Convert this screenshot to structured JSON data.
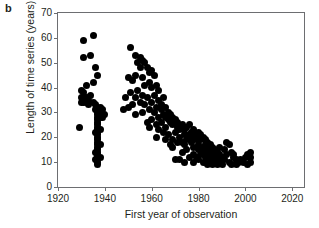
{
  "panel": {
    "label": "b"
  },
  "axes": {
    "xlabel": "First year of observation",
    "ylabel": "Length of time series (years)",
    "xticks": [
      1920,
      1940,
      1960,
      1980,
      2000,
      2020
    ],
    "yticks": [
      0,
      10,
      20,
      30,
      40,
      50,
      60,
      70
    ]
  },
  "chart_data": {
    "type": "scatter",
    "title": "",
    "xlabel": "First year of observation",
    "ylabel": "Length of time series (years)",
    "xlim": [
      1920,
      2025
    ],
    "ylim": [
      0,
      70
    ],
    "xticks": [
      1920,
      1940,
      1960,
      1980,
      2000,
      2020
    ],
    "yticks": [
      0,
      10,
      20,
      30,
      40,
      50,
      60,
      70
    ],
    "grid": false,
    "legend": null,
    "marker": {
      "shape": "circle",
      "color": "#000000",
      "size_px": 7
    },
    "points": [
      [
        1931,
        59
      ],
      [
        1935,
        61
      ],
      [
        1931,
        52
      ],
      [
        1934,
        53
      ],
      [
        1936,
        48
      ],
      [
        1937,
        45
      ],
      [
        1935,
        42
      ],
      [
        1932,
        41
      ],
      [
        1930,
        39
      ],
      [
        1931,
        38
      ],
      [
        1930,
        36
      ],
      [
        1932,
        36
      ],
      [
        1934,
        37
      ],
      [
        1933,
        35
      ],
      [
        1932,
        34
      ],
      [
        1931,
        34
      ],
      [
        1930,
        34
      ],
      [
        1933,
        33
      ],
      [
        1935,
        34
      ],
      [
        1936,
        33
      ],
      [
        1929,
        24
      ],
      [
        1937,
        32
      ],
      [
        1938,
        32
      ],
      [
        1939,
        31
      ],
      [
        1938,
        30
      ],
      [
        1937,
        31
      ],
      [
        1936,
        31
      ],
      [
        1938,
        28
      ],
      [
        1939,
        28
      ],
      [
        1940,
        29
      ],
      [
        1937,
        30
      ],
      [
        1937,
        29
      ],
      [
        1937,
        28
      ],
      [
        1937,
        27
      ],
      [
        1937,
        26
      ],
      [
        1937,
        25
      ],
      [
        1937,
        24
      ],
      [
        1937,
        23
      ],
      [
        1937,
        22
      ],
      [
        1937,
        21
      ],
      [
        1937,
        20
      ],
      [
        1937,
        19
      ],
      [
        1937,
        18
      ],
      [
        1937,
        17
      ],
      [
        1937,
        16
      ],
      [
        1937,
        15
      ],
      [
        1937,
        14
      ],
      [
        1937,
        13
      ],
      [
        1937,
        12
      ],
      [
        1937,
        11
      ],
      [
        1937,
        10
      ],
      [
        1937,
        9
      ],
      [
        1936,
        14
      ],
      [
        1936,
        11
      ],
      [
        1938,
        12
      ],
      [
        1938,
        17
      ],
      [
        1936,
        22
      ],
      [
        1938,
        23
      ],
      [
        1951,
        56
      ],
      [
        1953,
        53
      ],
      [
        1955,
        52
      ],
      [
        1956,
        51
      ],
      [
        1954,
        50
      ],
      [
        1957,
        50
      ],
      [
        1955,
        48
      ],
      [
        1958,
        48
      ],
      [
        1953,
        45
      ],
      [
        1950,
        44
      ],
      [
        1952,
        43
      ],
      [
        1956,
        44
      ],
      [
        1959,
        46
      ],
      [
        1960,
        47
      ],
      [
        1961,
        45
      ],
      [
        1959,
        42
      ],
      [
        1957,
        41
      ],
      [
        1954,
        39
      ],
      [
        1951,
        38
      ],
      [
        1949,
        36
      ],
      [
        1953,
        36
      ],
      [
        1956,
        37
      ],
      [
        1960,
        40
      ],
      [
        1962,
        41
      ],
      [
        1963,
        39
      ],
      [
        1961,
        37
      ],
      [
        1958,
        36
      ],
      [
        1955,
        34
      ],
      [
        1952,
        33
      ],
      [
        1950,
        32
      ],
      [
        1948,
        31
      ],
      [
        1957,
        33
      ],
      [
        1960,
        34
      ],
      [
        1963,
        35
      ],
      [
        1965,
        36
      ],
      [
        1964,
        33
      ],
      [
        1962,
        32
      ],
      [
        1959,
        31
      ],
      [
        1956,
        30
      ],
      [
        1953,
        29
      ],
      [
        1961,
        30
      ],
      [
        1964,
        31
      ],
      [
        1966,
        32
      ],
      [
        1967,
        30
      ],
      [
        1965,
        29
      ],
      [
        1963,
        28
      ],
      [
        1960,
        27
      ],
      [
        1958,
        26
      ],
      [
        1966,
        28
      ],
      [
        1968,
        29
      ],
      [
        1969,
        28
      ],
      [
        1967,
        27
      ],
      [
        1964,
        26
      ],
      [
        1962,
        25
      ],
      [
        1959,
        24
      ],
      [
        1968,
        26
      ],
      [
        1970,
        27
      ],
      [
        1971,
        26
      ],
      [
        1969,
        25
      ],
      [
        1966,
        24
      ],
      [
        1963,
        23
      ],
      [
        1971,
        24
      ],
      [
        1973,
        25
      ],
      [
        1972,
        23
      ],
      [
        1970,
        22
      ],
      [
        1967,
        21
      ],
      [
        1974,
        23
      ],
      [
        1975,
        24
      ],
      [
        1976,
        25
      ],
      [
        1974,
        21
      ],
      [
        1972,
        20
      ],
      [
        1969,
        19
      ],
      [
        1976,
        21
      ],
      [
        1977,
        22
      ],
      [
        1978,
        23
      ],
      [
        1977,
        20
      ],
      [
        1975,
        19
      ],
      [
        1973,
        18
      ],
      [
        1979,
        21
      ],
      [
        1980,
        22
      ],
      [
        1981,
        21
      ],
      [
        1979,
        19
      ],
      [
        1977,
        18
      ],
      [
        1974,
        17
      ],
      [
        1981,
        19
      ],
      [
        1982,
        20
      ],
      [
        1983,
        19
      ],
      [
        1980,
        17
      ],
      [
        1978,
        16
      ],
      [
        1983,
        17
      ],
      [
        1984,
        18
      ],
      [
        1982,
        16
      ],
      [
        1980,
        15
      ],
      [
        1985,
        17
      ],
      [
        1986,
        16
      ],
      [
        1984,
        15
      ],
      [
        1982,
        14
      ],
      [
        1986,
        14
      ],
      [
        1987,
        15
      ],
      [
        1985,
        13
      ],
      [
        1983,
        12
      ],
      [
        1987,
        13
      ],
      [
        1988,
        14
      ],
      [
        1986,
        12
      ],
      [
        1984,
        11
      ],
      [
        1988,
        12
      ],
      [
        1989,
        13
      ],
      [
        1987,
        11
      ],
      [
        1985,
        10
      ],
      [
        1970,
        11
      ],
      [
        1972,
        11
      ],
      [
        1974,
        10
      ],
      [
        1976,
        12
      ],
      [
        1978,
        13
      ],
      [
        1979,
        12
      ],
      [
        1981,
        13
      ],
      [
        1983,
        14
      ],
      [
        1989,
        11
      ],
      [
        1990,
        12
      ],
      [
        1991,
        11
      ],
      [
        1992,
        18
      ],
      [
        1993,
        17
      ],
      [
        1994,
        14
      ],
      [
        1995,
        13
      ],
      [
        1995,
        12
      ],
      [
        1996,
        11
      ],
      [
        1996,
        10
      ],
      [
        1996,
        9
      ],
      [
        1997,
        10
      ],
      [
        1998,
        11
      ],
      [
        1999,
        10
      ],
      [
        2000,
        12
      ],
      [
        2001,
        13
      ],
      [
        2002,
        14
      ],
      [
        2002,
        12
      ],
      [
        2002,
        10
      ],
      [
        2001,
        9
      ],
      [
        1993,
        10
      ],
      [
        1991,
        15
      ],
      [
        1989,
        16
      ],
      [
        1992,
        13
      ],
      [
        1990,
        9
      ],
      [
        1994,
        9
      ],
      [
        1988,
        9
      ],
      [
        1986,
        9
      ],
      [
        1984,
        9
      ],
      [
        1982,
        10
      ],
      [
        1980,
        11
      ],
      [
        1978,
        10
      ],
      [
        1975,
        15
      ],
      [
        1973,
        14
      ],
      [
        1971,
        18
      ],
      [
        1968,
        17
      ],
      [
        1965,
        22
      ],
      [
        1962,
        20
      ],
      [
        1966,
        19
      ],
      [
        1969,
        16
      ]
    ]
  }
}
